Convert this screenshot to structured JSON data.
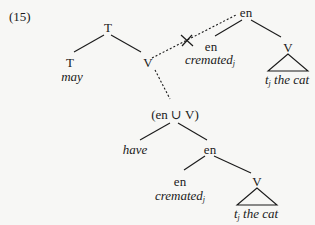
{
  "example_number": "(15)",
  "upper_tree": {
    "root": "T",
    "left": {
      "label": "T",
      "word": "may"
    },
    "right": {
      "label": "V"
    }
  },
  "moved_tree": {
    "root": "en",
    "left": {
      "label": "en",
      "word": "cremated",
      "index": "j"
    },
    "right": {
      "label": "V",
      "trace": "t",
      "trace_index": "j",
      "phrase": " the cat"
    }
  },
  "merged_node": "(en ∪ V)",
  "lower_tree": {
    "left_word": "have",
    "right": {
      "label": "en",
      "left": {
        "label": "en",
        "word": "cremated",
        "index": "j"
      },
      "right": {
        "label": "V",
        "trace": "t",
        "trace_index": "j",
        "phrase": " the cat"
      }
    }
  },
  "annotations": {
    "blocked_link_mark": "✕",
    "line_style_dotted": "dotted",
    "line_color": "#1a1a1a"
  }
}
